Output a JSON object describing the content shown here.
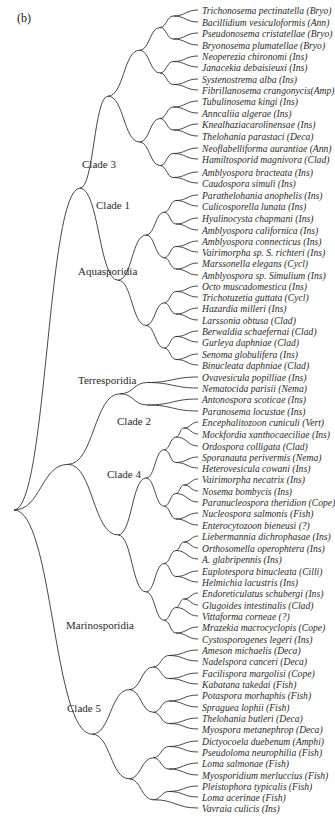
{
  "figure": {
    "panel_label": "(b)",
    "line_color": "#333333",
    "clade_labels": [
      {
        "name": "Clade 3",
        "x": 82,
        "y": 165
      },
      {
        "name": "Clade 1",
        "x": 96,
        "y": 206
      },
      {
        "name": "Aquasporidia",
        "x": 78,
        "y": 272
      },
      {
        "name": "Terresporidia",
        "x": 78,
        "y": 381
      },
      {
        "name": "Clade 2",
        "x": 117,
        "y": 422
      },
      {
        "name": "Clade 4",
        "x": 107,
        "y": 475
      },
      {
        "name": "Marinosporidia",
        "x": 66,
        "y": 626
      },
      {
        "name": "Clade 5",
        "x": 67,
        "y": 709
      }
    ],
    "leaves": [
      "Trichonosema pectinatella (Bryo)",
      "Bacillidium vesiculoformis (Ann)",
      "Pseudonosema cristatellae (Bryo)",
      "Bryonosema plumatellae (Bryo)",
      "Neoperezia chironomi (Ins)",
      "Janacekia debaisieuxi (Ins)",
      "Systenostrema alba (Ins)",
      "Fibrillanosema crangonycis(Amp)",
      "Tubulinosema kingi (Ins)",
      "Anncaliia algerae (Ins)",
      "Knealhaziacarolinensae (Ins)",
      "Thelohania parastaci (Deca)",
      "Neoflabelliforma aurantiae (Ann)",
      "Hamiltosporid magnivora (Clad)",
      "Amblyospora bracteata (Ins)",
      "Caudospora simuli (Ins)",
      "Parathelohania anophelis (Ins)",
      "Culicosporella lunata (Ins)",
      "Hyalinocysta chapmani (Ins)",
      "Amblyospora californica (Ins)",
      "Amblyospora connecticus (Ins)",
      "Vairimorpha sp. S. richteri (Ins)",
      "Marssonella elegans (Cycl)",
      "Amblyospora sp. Simulium (Ins)",
      "Octo muscadomestica (Ins)",
      "Trichotuzetia guttata (Cycl)",
      "Hazardia milleri (Ins)",
      "Larssonia obtusa (Clad)",
      "Berwaldia schaefernai (Clad)",
      "Gurleya daphniae (Clad)",
      "Senoma globulifera (Ins)",
      "Binucleata daphniae (Clad)",
      "Ovavesicula popilliae (Ins)",
      "Nematocida parisii (Nema)",
      "Antonospora scoticae (Ins)",
      "Paranosema locustae (Ins)",
      "Encephalitozoon cuniculi (Vert)",
      "Mockfordia xanthocaeciliae (Ins)",
      "Ordospora colligata (Clad)",
      "Sporanauta perivermis (Nema)",
      "Heterovesicula cowani (Ins)",
      "Vairimorpha necatrix (Ins)",
      "Nosema bombycis (Ins)",
      "Paranucleospora theridion (Cope)",
      "Nucleospora salmonis (Fish)",
      "Enterocytozoon bieneusi (?)",
      "Liebermannia dichrophasae (Ins)",
      "Orthosomella operophtera (Ins)",
      "A. glabripennis (Ins)",
      "Euplotespora binucleata (Cilli)",
      "Helmichia lacustris (Ins)",
      "Endoreticulatus schubergi (Ins)",
      "Glugoides intestinalis (Clad)",
      "Vittaforma corneae (?)",
      "Mrazekia macrocyclopis (Cope)",
      "Cystosporogenes legeri (Ins)",
      "Ameson michaelis (Deca)",
      "Nadelspora canceri (Deca)",
      "Facilispora margolisi (Cope)",
      "Kabatana takedai (Fish)",
      "Potaspora morhaphis (Fish)",
      "Spraguea lophii (Fish)",
      "Thelohania butleri (Deca)",
      "Myospora metanephrop (Deca)",
      "Dictyocoela duebenum (Amphi)",
      "Pseudoloma neurophilia (Fish)",
      "Loma salmonae (Fish)",
      "Myosporidium merluccius (Fish)",
      "Pleistophora typicalis (Fish)",
      "Loma acerinae (Fish)",
      "Vavraia culicis (Ins)"
    ],
    "leaf_y": [
      10,
      22,
      33,
      45,
      56,
      67,
      79,
      90,
      101,
      113,
      124,
      136,
      148,
      159,
      172,
      183,
      195,
      206,
      218,
      230,
      241,
      252,
      263,
      275,
      286,
      297,
      308,
      320,
      331,
      342,
      354,
      365,
      377,
      388,
      399,
      411,
      422,
      434,
      446,
      457,
      468,
      479,
      491,
      502,
      513,
      525,
      536,
      548,
      559,
      571,
      582,
      593,
      605,
      616,
      627,
      639,
      650,
      661,
      673,
      684,
      695,
      707,
      718,
      729,
      741,
      752,
      763,
      775,
      786,
      797,
      808
    ]
  }
}
